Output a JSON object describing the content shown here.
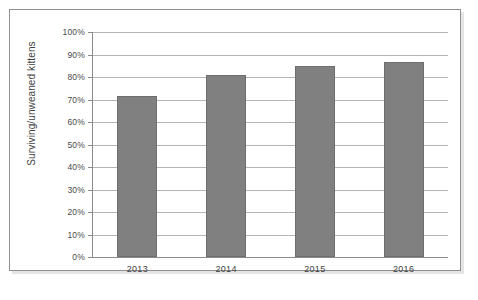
{
  "figure": {
    "background_color": "#ffffff",
    "frame_border_color": "#8f8f8f"
  },
  "chart_data": {
    "type": "bar",
    "title": "",
    "subtitle": "",
    "xlabel": "",
    "ylabel": "Surviving/unweaned kittens",
    "categories": [
      "2013",
      "2014",
      "2015",
      "2016"
    ],
    "values": [
      71.5,
      81,
      85,
      86.7
    ],
    "value_unit": "%",
    "ylim": [
      0,
      100
    ],
    "ytick_values": [
      0,
      10,
      20,
      30,
      40,
      50,
      60,
      70,
      80,
      90,
      100
    ],
    "ytick_labels": [
      "0%",
      "10%",
      "20%",
      "30%",
      "40%",
      "50%",
      "60%",
      "70%",
      "80%",
      "90%",
      "100%"
    ],
    "grid": true,
    "grid_axis": "y",
    "grid_color": "#b4b4b4",
    "legend": false,
    "legend_position": "none",
    "series": [
      {
        "name": "Surviving/unweaned kittens",
        "color": "#808080",
        "edge_color": "#6e6e6e",
        "values": [
          71.5,
          81,
          85,
          86.7
        ]
      }
    ],
    "annotations": []
  }
}
